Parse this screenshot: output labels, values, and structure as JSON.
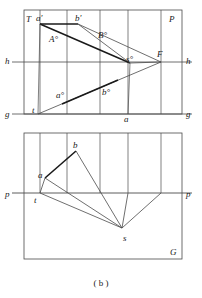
{
  "figure": {
    "caption": "( b )",
    "colors": {
      "stroke": "#4a4a4a",
      "stroke_bold": "#1a1a1a",
      "text": "#1a1a1a",
      "background": "#ffffff"
    },
    "upper_view": {
      "frame_labels": {
        "corner_top_left": "T",
        "corner_top_right": "P",
        "h_left": "h",
        "h_right": "h",
        "g_left": "g",
        "g_right": "g"
      },
      "points": [
        {
          "name": "a-prime",
          "label": "a'",
          "x": 40,
          "y": 20
        },
        {
          "name": "b-prime",
          "label": "b'",
          "x": 80,
          "y": 20
        },
        {
          "name": "A-circle",
          "label": "A°",
          "x": 55,
          "y": 40
        },
        {
          "name": "B-circle",
          "label": "B°",
          "x": 104,
          "y": 35
        },
        {
          "name": "s-circle",
          "label": "s°",
          "x": 131,
          "y": 60
        },
        {
          "name": "F",
          "label": "F",
          "x": 161,
          "y": 53
        },
        {
          "name": "t",
          "label": "t",
          "x": 38,
          "y": 112
        },
        {
          "name": "a-circle-low",
          "label": "a°",
          "x": 62,
          "y": 95
        },
        {
          "name": "b-circle-low",
          "label": "b°",
          "x": 108,
          "y": 92
        },
        {
          "name": "a-low",
          "label": "a",
          "x": 128,
          "y": 118
        }
      ]
    },
    "lower_view": {
      "frame_labels": {
        "p_left": "p",
        "p_right": "p",
        "corner_bottom_right": "G"
      },
      "points": [
        {
          "name": "b",
          "label": "b",
          "x": 75,
          "y": 147
        },
        {
          "name": "a",
          "label": "a",
          "x": 43,
          "y": 177
        },
        {
          "name": "t",
          "label": "t",
          "x": 40,
          "y": 200
        },
        {
          "name": "s",
          "label": "s",
          "x": 126,
          "y": 240
        }
      ]
    }
  }
}
